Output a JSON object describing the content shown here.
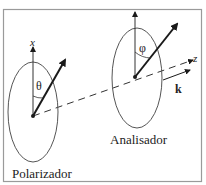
{
  "frame": {
    "border_color": "#9a9a9a"
  },
  "polarizer": {
    "label": "Polarizador",
    "axis_label": "x",
    "angle_label": "θ"
  },
  "analyzer": {
    "label": "Analisador",
    "angle_label": "φ"
  },
  "propagation": {
    "axis_label": "z",
    "wavevector_label": "k"
  },
  "colors": {
    "stroke": "#1a1a1a",
    "ellipse": "#555555"
  }
}
